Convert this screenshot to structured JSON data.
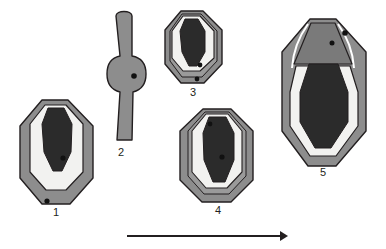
{
  "figure": {
    "title": "",
    "type": "developmental-stage-series",
    "background_color": "#ffffff",
    "palette": {
      "outer_gray": "#8d8d8d",
      "mid_gray": "#9a9a9a",
      "dark_gray_wedge": "#7a7a7a",
      "white_ring": "#f2f2f0",
      "core_dark": "#2b2b2b",
      "outline": "#231f20",
      "highlight_white": "#ffffff",
      "label_color": "#231f20",
      "arrow_color": "#231f20"
    },
    "specimens": [
      {
        "id": "specimen-1",
        "label": "1",
        "label_x": 56,
        "label_y": 212,
        "shape": "octagonal",
        "layers": [
          "outer_gray",
          "white_ring",
          "core_dark"
        ],
        "dots": 2,
        "dot_positions": [
          [
            63,
            158
          ],
          [
            47,
            201
          ]
        ]
      },
      {
        "id": "specimen-2",
        "label": "2",
        "label_x": 121,
        "label_y": 152,
        "shape": "elongated-bulbous",
        "layers": [
          "outer_gray"
        ],
        "dots": 1,
        "dot_positions": [
          [
            134,
            76
          ]
        ]
      },
      {
        "id": "specimen-3",
        "label": "3",
        "label_x": 193,
        "label_y": 92,
        "shape": "octagonal",
        "layers": [
          "outer_gray",
          "mid_gray",
          "white_ring",
          "core_dark"
        ],
        "dots": 2,
        "dot_positions": [
          [
            200,
            65
          ],
          [
            197,
            79
          ]
        ]
      },
      {
        "id": "specimen-4",
        "label": "4",
        "label_x": 218,
        "label_y": 210,
        "shape": "octagonal",
        "layers": [
          "outer_gray",
          "mid_gray",
          "white_ring",
          "core_dark"
        ],
        "dots": 2,
        "dot_positions": [
          [
            210,
            124
          ],
          [
            222,
            157
          ]
        ]
      },
      {
        "id": "specimen-5",
        "label": "5",
        "label_x": 323,
        "label_y": 172,
        "shape": "octagonal-with-apical-wedge",
        "layers": [
          "outer_gray",
          "dark_gray_wedge",
          "white_ring",
          "core_dark"
        ],
        "dots": 2,
        "dot_positions": [
          [
            332,
            43
          ],
          [
            345,
            33
          ]
        ]
      }
    ],
    "arrow": {
      "name": "progression-arrow",
      "x1": 127,
      "y1": 236,
      "x2": 286,
      "y2": 236,
      "direction": "left-to-right",
      "color": "#231f20"
    }
  }
}
